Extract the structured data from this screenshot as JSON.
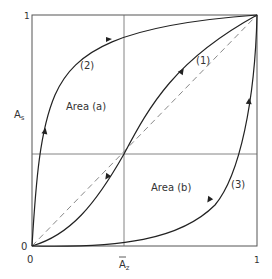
{
  "diagram": {
    "frame": {
      "x0": 32,
      "y0": 15,
      "x1": 257,
      "y1": 246
    },
    "center": {
      "x": 124,
      "y": 154
    },
    "colors": {
      "frame": "#555555",
      "grid": "#666666",
      "curve": "#222222",
      "dashed": "#888888",
      "text": "#333333"
    },
    "axes": {
      "y_label": "A",
      "y_label_sub": "s",
      "x_label": "A",
      "x_label_sub": "z",
      "y_tick_top": "1",
      "y_tick_bottom": "0",
      "x_tick_left": "0",
      "x_tick_right": "1"
    },
    "curves": [
      {
        "id": "curve-1",
        "label": "(1)"
      },
      {
        "id": "curve-2",
        "label": "(2)"
      },
      {
        "id": "curve-3",
        "label": "(3)"
      }
    ],
    "areas": [
      {
        "id": "area-a",
        "label": "Area (a)"
      },
      {
        "id": "area-b",
        "label": "Area (b)"
      }
    ]
  }
}
